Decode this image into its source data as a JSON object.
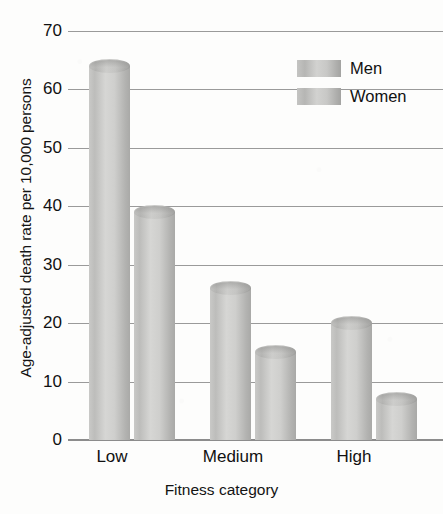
{
  "chart_data": {
    "type": "bar",
    "title": "",
    "xlabel": "Fitness category",
    "ylabel": "Age-adjusted death rate per 10,000 persons",
    "categories": [
      "Low",
      "Medium",
      "High"
    ],
    "series": [
      {
        "name": "Men",
        "values": [
          64,
          26,
          20
        ]
      },
      {
        "name": "Women",
        "values": [
          39,
          15,
          7
        ]
      }
    ],
    "ylim": [
      0,
      70
    ],
    "ytick_step": 10,
    "yticks": [
      0,
      10,
      20,
      30,
      40,
      50,
      60,
      70
    ],
    "ytick_labels": [
      "0",
      "10",
      "20",
      "30",
      "40",
      "50",
      "60",
      "70"
    ],
    "grid": true,
    "legend_position": "top-right",
    "bar_style": "3d-cylinder",
    "colors": {
      "bar_light": "#d6d6d4",
      "bar_mid": "#c4c4c2",
      "bar_dark": "#a3a3a1",
      "gridline": "#9a9a9a",
      "axis": "#8c8c8c",
      "text": "#111111",
      "background": "#fdfdfc"
    }
  },
  "legend": {
    "items": [
      {
        "label": "Men"
      },
      {
        "label": "Women"
      }
    ]
  }
}
